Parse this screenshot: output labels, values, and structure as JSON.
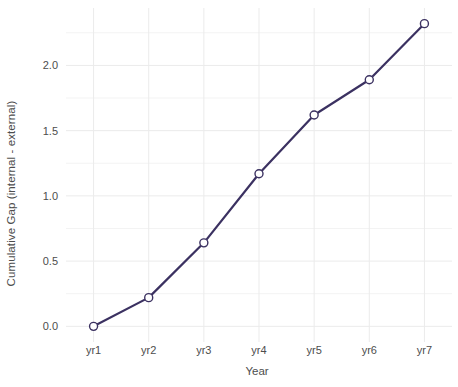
{
  "chart_data": {
    "type": "line",
    "title": "",
    "subtitle": "",
    "xlabel": "Year",
    "ylabel": "Cumulative Gap (internal - external)",
    "categories": [
      "yr1",
      "yr2",
      "yr3",
      "yr4",
      "yr5",
      "yr6",
      "yr7"
    ],
    "values": [
      0.0,
      0.22,
      0.64,
      1.17,
      1.62,
      1.89,
      2.32
    ],
    "series": [
      {
        "name": "Cumulative Gap",
        "values": [
          0.0,
          0.22,
          0.64,
          1.17,
          1.62,
          1.89,
          2.32
        ]
      }
    ],
    "ylim": [
      -0.12,
      2.44
    ],
    "yticks": [
      0.0,
      0.5,
      1.0,
      1.5,
      2.0
    ],
    "ytick_labels": [
      "0.0",
      "0.5",
      "1.0",
      "1.5",
      "2.0"
    ],
    "xtick_labels": [
      "yr1",
      "yr2",
      "yr3",
      "yr4",
      "yr5",
      "yr6",
      "yr7"
    ],
    "grid": true,
    "legend": "none",
    "line_color": "#3b3161",
    "marker_shape": "open-circle",
    "marker_fill": "#ffffff",
    "marker_stroke": "#3b3161",
    "panel_background": "#ffffff",
    "grid_color": "#ebebeb",
    "text_color": "#4d4d4d"
  }
}
